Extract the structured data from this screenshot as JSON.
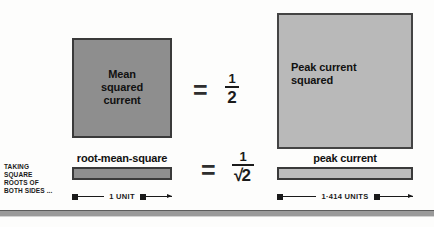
{
  "diagram": {
    "top_row": {
      "left_square": {
        "label": "Mean\nsquared\ncurrent",
        "line1": "Mean",
        "line2": "squared",
        "line3": "current",
        "fill": "#8e8e8e"
      },
      "equals": "=",
      "fraction": {
        "numerator": "1",
        "denominator": "2"
      },
      "right_square": {
        "line1": "Peak current",
        "line2": "squared",
        "fill": "#b9b9b9"
      }
    },
    "bottom_row": {
      "caption": {
        "line1": "TAKING",
        "line2": "SQUARE",
        "line3": "ROOTS OF",
        "line4": "BOTH SIDES ..."
      },
      "left_bar": {
        "label": "root-mean-square",
        "fill": "#8e8e8e"
      },
      "equals": "=",
      "fraction": {
        "numerator": "1",
        "radical_sign": "√",
        "denominator": "2"
      },
      "right_bar": {
        "label": "peak current",
        "fill": "#bcbcbc"
      }
    },
    "dimensions": {
      "left": "1 UNIT",
      "right": "1·414 UNITS"
    }
  }
}
